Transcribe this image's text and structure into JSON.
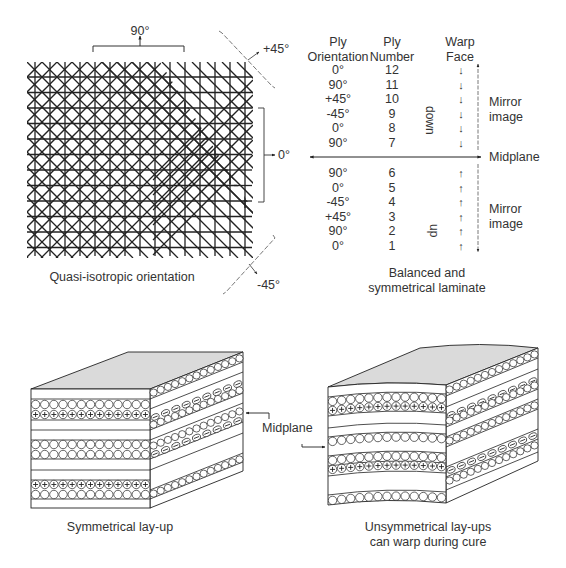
{
  "quasi_isotropic": {
    "caption": "Quasi-isotropic orientation",
    "labels": {
      "deg90": "90°",
      "plus45": "+45°",
      "zero": "0°",
      "minus45": "-45°"
    }
  },
  "laminate_table": {
    "headers": {
      "orientation": [
        "Ply",
        "Orientation"
      ],
      "number": [
        "Ply",
        "Number"
      ],
      "warp": [
        "Warp",
        "Face"
      ]
    },
    "upper_rows": [
      {
        "orientation": "0°",
        "number": "12",
        "warp": "↓"
      },
      {
        "orientation": "90°",
        "number": "11",
        "warp": "↓"
      },
      {
        "orientation": "+45°",
        "number": "10",
        "warp": "↓"
      },
      {
        "orientation": "-45°",
        "number": "9",
        "warp": "↓"
      },
      {
        "orientation": "0°",
        "number": "8",
        "warp": "↓"
      },
      {
        "orientation": "90°",
        "number": "7",
        "warp": "↓"
      }
    ],
    "lower_rows": [
      {
        "orientation": "90°",
        "number": "6",
        "warp": "↑"
      },
      {
        "orientation": "0°",
        "number": "5",
        "warp": "↑"
      },
      {
        "orientation": "-45°",
        "number": "4",
        "warp": "↑"
      },
      {
        "orientation": "+45°",
        "number": "3",
        "warp": "↑"
      },
      {
        "orientation": "90°",
        "number": "2",
        "warp": "↑"
      },
      {
        "orientation": "0°",
        "number": "1",
        "warp": "↑"
      }
    ],
    "down_label": "down",
    "up_label": "up",
    "mirror_top": [
      "Mirror",
      "image"
    ],
    "mirror_bottom": [
      "Mirror",
      "image"
    ],
    "midplane": "Midplane",
    "caption": [
      "Balanced and",
      "symmetrical laminate"
    ]
  },
  "layups": {
    "midplane_label": "Midplane",
    "symmetrical_caption": "Symmetrical lay-up",
    "unsymmetrical_caption": [
      "Unsymmetrical lay-ups",
      "can warp during cure"
    ]
  },
  "colors": {
    "line": "#222222",
    "top_face": "#d9d9d9",
    "dashed": "#777777"
  }
}
